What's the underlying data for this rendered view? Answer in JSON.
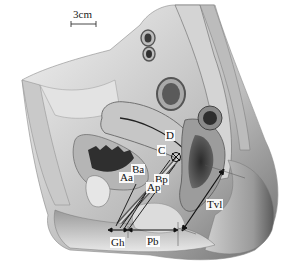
{
  "figure": {
    "style": "grayscale anatomical illustration",
    "scale_bar": {
      "label": "3cm"
    },
    "labels": {
      "D": "D",
      "C": "C",
      "Ba": "Ba",
      "Aa": "Aa",
      "Bp": "Bp",
      "Ap": "Ap",
      "Gh": "Gh",
      "Pb": "Pb",
      "Tvl": "Tvl"
    },
    "measurements": [
      {
        "id": "Gh",
        "name": "genital hiatus",
        "orientation": "horizontal"
      },
      {
        "id": "Pb",
        "name": "perineal body",
        "orientation": "horizontal"
      },
      {
        "id": "Tvl",
        "name": "total vaginal length",
        "orientation": "diagonal"
      }
    ],
    "colors": {
      "tissue_light": "#d9d9d9",
      "tissue_mid": "#a8a8a8",
      "tissue_dark": "#4a4a4a",
      "line": "#111111",
      "background": "#ffffff"
    }
  }
}
